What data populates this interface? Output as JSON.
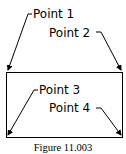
{
  "figure": {
    "caption": "Figure 11.003",
    "points": [
      {
        "label": "Point 1"
      },
      {
        "label": "Point 2"
      },
      {
        "label": "Point 3"
      },
      {
        "label": "Point 4"
      }
    ]
  },
  "colors": {
    "line": "#000000",
    "background": "#ffffff"
  }
}
